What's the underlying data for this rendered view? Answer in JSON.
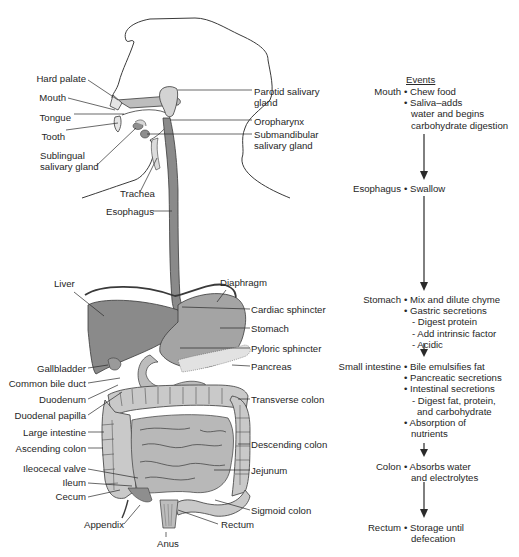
{
  "anatomy_labels": {
    "left": [
      "Hard palate",
      "Mouth",
      "Tongue",
      "Tooth",
      "Sublingual\nsalivary gland",
      "Trachea",
      "Esophagus",
      "Liver",
      "Gallbladder",
      "Common bile duct",
      "Duodenum",
      "Duodenal papilla",
      "Large intestine",
      "Ascending colon",
      "Ileocecal valve",
      "Ileum",
      "Cecum",
      "Appendix",
      "Anus"
    ],
    "right": [
      "Parotid salivary\ngland",
      "Oropharynx",
      "Submandibular\nsalivary gland",
      "Diaphragm",
      "Cardiac sphincter",
      "Stomach",
      "Pyloric sphincter",
      "Pancreas",
      "Transverse colon",
      "Descending colon",
      "Jejunum",
      "Sigmoid colon",
      "Rectum"
    ]
  },
  "events": {
    "title": "Events",
    "stages": [
      {
        "stage": "Mouth",
        "items": [
          {
            "t": "• Chew food",
            "k": "item"
          },
          {
            "t": "• Saliva–adds",
            "k": "item"
          },
          {
            "t": "water and begins",
            "k": "cont"
          },
          {
            "t": "carbohydrate digestion",
            "k": "cont"
          }
        ]
      },
      {
        "stage": "Esophagus",
        "items": [
          {
            "t": "• Swallow",
            "k": "item"
          }
        ]
      },
      {
        "stage": "Stomach",
        "items": [
          {
            "t": "• Mix and dilute chyme",
            "k": "item"
          },
          {
            "t": "• Gastric secretions",
            "k": "item"
          },
          {
            "t": "- Digest protein",
            "k": "sub"
          },
          {
            "t": "- Add intrinsic factor",
            "k": "sub"
          },
          {
            "t": "- Acidic",
            "k": "sub"
          }
        ]
      },
      {
        "stage": "Small intestine",
        "items": [
          {
            "t": "• Bile emulsifies fat",
            "k": "item"
          },
          {
            "t": "• Pancreatic secretions",
            "k": "item"
          },
          {
            "t": "• Intestinal secretions",
            "k": "item"
          },
          {
            "t": "- Digest fat, protein,",
            "k": "sub"
          },
          {
            "t": "and carbohydrate",
            "k": "subcont"
          },
          {
            "t": "• Absorption of",
            "k": "item"
          },
          {
            "t": "nutrients",
            "k": "cont"
          }
        ]
      },
      {
        "stage": "Colon",
        "items": [
          {
            "t": "• Absorbs water",
            "k": "item"
          },
          {
            "t": "and electrolytes",
            "k": "cont"
          }
        ]
      },
      {
        "stage": "Rectum",
        "items": [
          {
            "t": "• Storage until",
            "k": "item"
          },
          {
            "t": "defecation",
            "k": "cont"
          }
        ]
      }
    ]
  },
  "colors": {
    "organ_dark": "#8a8a8a",
    "organ_mid": "#a9a9a9",
    "organ_light": "#cfcfcf",
    "outline": "#3a3a3a",
    "text": "#262626"
  }
}
